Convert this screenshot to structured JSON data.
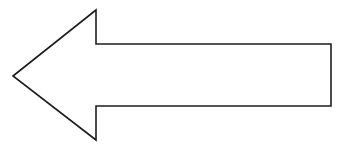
{
  "diagram": {
    "shape": "left-arrow",
    "icon": "arrow-left-icon",
    "stroke_color": "#1e1e1e",
    "fill_color": "#ffffff",
    "background_color": "#ffffff",
    "stroke_width": 1.6,
    "points": "13,76 96,10 96,44 331,44 331,106 96,106 96,140"
  }
}
